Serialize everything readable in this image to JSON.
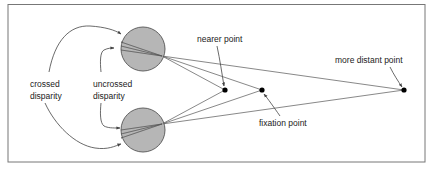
{
  "diagram": {
    "labels": {
      "crossed_line1": "crossed",
      "crossed_line2": "disparity",
      "uncrossed_line1": "uncrossed",
      "uncrossed_line2": "disparity",
      "nearer_point": "nearer point",
      "fixation_point": "fixation point",
      "more_distant_point": "more distant point"
    },
    "colors": {
      "eye_fill": "#a9a9a9",
      "lines": "#555555",
      "points": "#000000"
    }
  }
}
